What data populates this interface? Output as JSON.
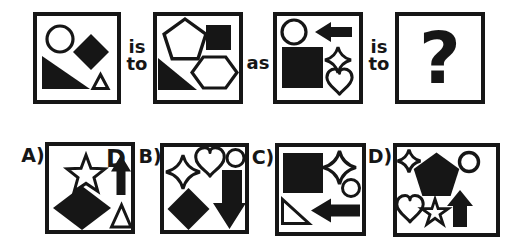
{
  "colors": {
    "ink": "#161616",
    "background": "#ffffff"
  },
  "analogy": {
    "connectors": {
      "first": {
        "line1": "is",
        "line2": "to"
      },
      "middle": "as",
      "second": {
        "line1": "is",
        "line2": "to"
      }
    },
    "unknown_mark": "?",
    "premise_boxes": [
      {
        "id": "first-term",
        "shapes": [
          "outline-circle",
          "filled-diamond",
          "filled-right-triangle",
          "outline-triangle"
        ]
      },
      {
        "id": "second-term",
        "shapes": [
          "outline-pentagon",
          "filled-square",
          "filled-right-triangle",
          "outline-hexagon"
        ]
      },
      {
        "id": "third-term",
        "shapes": [
          "outline-circle",
          "filled-left-arrow",
          "filled-square",
          "outline-four-point-star",
          "outline-heart"
        ]
      },
      {
        "id": "fourth-term",
        "shapes": [
          "question-mark"
        ]
      }
    ]
  },
  "options": [
    {
      "label": "A)",
      "letter_glyph": "D",
      "shapes": [
        "outline-five-point-star",
        "letter-D",
        "filled-up-arrow",
        "filled-diamond",
        "outline-triangle"
      ]
    },
    {
      "label": "B)",
      "shapes": [
        "outline-four-point-star",
        "outline-heart",
        "outline-circle",
        "filled-diamond",
        "filled-down-arrow"
      ]
    },
    {
      "label": "C)",
      "shapes": [
        "filled-square",
        "outline-four-point-star",
        "outline-circle",
        "outline-right-triangle",
        "filled-left-arrow"
      ]
    },
    {
      "label": "D)",
      "shapes": [
        "outline-four-point-star",
        "filled-pentagon",
        "outline-circle",
        "outline-heart",
        "outline-five-point-star",
        "filled-up-arrow"
      ]
    }
  ]
}
